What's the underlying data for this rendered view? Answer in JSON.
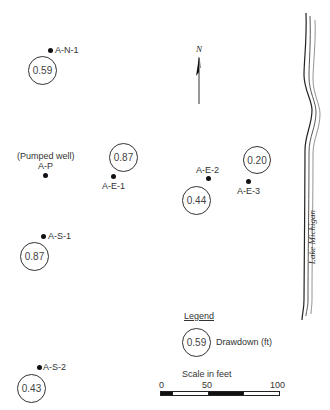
{
  "map": {
    "north_label": "N",
    "lake_label": "Lake Michigan",
    "pumped_well_note": "(Pumped well)",
    "wells": [
      {
        "id": "A-N-1",
        "label": "A-N-1",
        "drawdown": "0.59"
      },
      {
        "id": "A-P",
        "label": "A-P"
      },
      {
        "id": "A-E-1",
        "label": "A-E-1",
        "drawdown": "0.87"
      },
      {
        "id": "A-E-2",
        "label": "A-E-2",
        "drawdown": "0.44"
      },
      {
        "id": "A-E-3",
        "label": "A-E-3",
        "drawdown": "0.20"
      },
      {
        "id": "A-S-1",
        "label": "A-S-1",
        "drawdown": "0.87"
      },
      {
        "id": "A-S-2",
        "label": "A-S-2",
        "drawdown": "0.43"
      }
    ]
  },
  "legend": {
    "title": "Legend",
    "sample_value": "0.59",
    "sample_label": "Drawdown (ft)"
  },
  "scale": {
    "title": "Scale in feet",
    "ticks": [
      "0",
      "50",
      "100"
    ]
  }
}
